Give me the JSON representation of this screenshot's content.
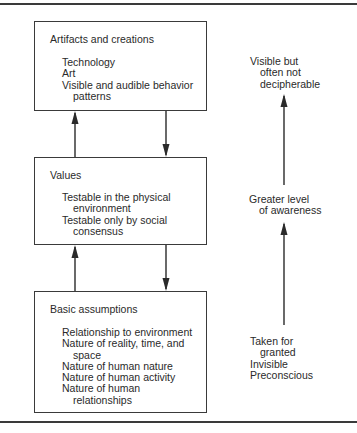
{
  "diagram": {
    "levels": [
      {
        "id": "artifacts",
        "title": "Artifacts and creations",
        "items": [
          {
            "text": "Technology",
            "cont": ""
          },
          {
            "text": "Art",
            "cont": ""
          },
          {
            "text": "Visible and audible behavior",
            "cont": "patterns"
          }
        ]
      },
      {
        "id": "values",
        "title": "Values",
        "items": [
          {
            "text": "Testable in the physical",
            "cont": "environment"
          },
          {
            "text": "Testable only by social",
            "cont": "consensus"
          }
        ]
      },
      {
        "id": "assumptions",
        "title": "Basic assumptions",
        "items": [
          {
            "text": "Relationship to environment",
            "cont": ""
          },
          {
            "text": "Nature of reality, time, and",
            "cont": "space"
          },
          {
            "text": "Nature of human nature",
            "cont": ""
          },
          {
            "text": "Nature of human activity",
            "cont": ""
          },
          {
            "text": "Nature of human",
            "cont": "relationships"
          }
        ]
      }
    ],
    "awareness_scale": {
      "top": {
        "line1": "Visible but",
        "line2": "often not",
        "line3": "decipherable"
      },
      "middle": {
        "line1": "Greater level",
        "line2": "of awareness"
      },
      "bottom": {
        "line1": "Taken for",
        "line2": "granted",
        "line3": "Invisible",
        "line4": "Preconscious"
      }
    },
    "connections": [
      {
        "from": "values",
        "to": "artifacts",
        "direction": "up"
      },
      {
        "from": "artifacts",
        "to": "values",
        "direction": "down"
      },
      {
        "from": "assumptions",
        "to": "values",
        "direction": "up"
      },
      {
        "from": "values",
        "to": "assumptions",
        "direction": "down"
      },
      {
        "from": "bottom",
        "to": "middle",
        "direction": "up",
        "column": "awareness"
      },
      {
        "from": "middle",
        "to": "top",
        "direction": "up",
        "column": "awareness"
      }
    ],
    "colors": {
      "ink": "#2a2a2a",
      "line": "#3a3a3a",
      "background": "#ffffff"
    }
  }
}
